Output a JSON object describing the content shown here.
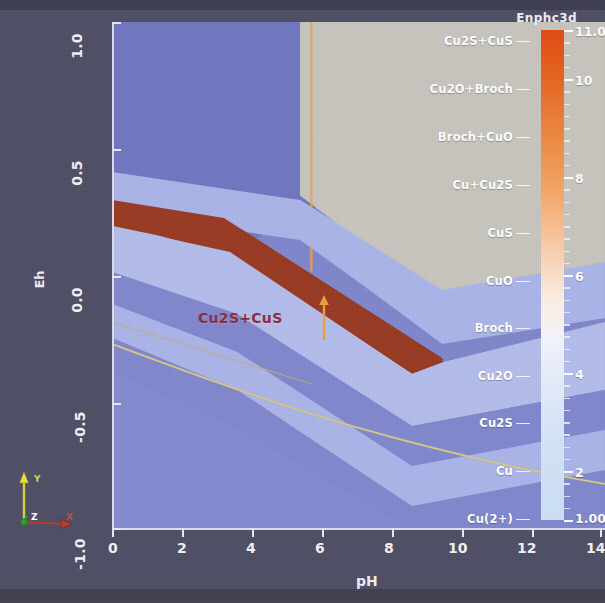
{
  "title": "Enphc3d",
  "axes": {
    "x": {
      "label": "pH",
      "ticks": [
        "0",
        "2",
        "4",
        "6",
        "8",
        "10",
        "12",
        "14"
      ],
      "min": 0,
      "max": 14
    },
    "y": {
      "label": "Eh",
      "ticks": [
        "1.0",
        "0.5",
        "0.0",
        "-0.5",
        "-1.0"
      ],
      "min": -1.0,
      "max": 1.0
    }
  },
  "colorbar": {
    "ticks": [
      "11.0",
      "10",
      "8",
      "6",
      "4",
      "2",
      "1.00"
    ],
    "values": [
      11.0,
      10,
      8,
      6,
      4,
      2,
      1.0
    ],
    "top_color": "#e14a0f",
    "bottom_color": "#cde0f6"
  },
  "region_labels": [
    {
      "text": "Cu2S+CuS",
      "y": 40
    },
    {
      "text": "Cu2O+Broch",
      "y": 88
    },
    {
      "text": "Broch+CuO",
      "y": 136
    },
    {
      "text": "Cu+Cu2S",
      "y": 184
    },
    {
      "text": "CuS",
      "y": 232
    },
    {
      "text": "CuO",
      "y": 280
    },
    {
      "text": "Broch",
      "y": 327
    },
    {
      "text": "Cu2O",
      "y": 375
    },
    {
      "text": "Cu2S",
      "y": 422
    },
    {
      "text": "Cu",
      "y": 470
    },
    {
      "text": "Cu(2+)",
      "y": 518
    }
  ],
  "annotation": {
    "text": "Cu2S+CuS",
    "color": "#8c2a3c",
    "arrow_color": "#e8a13c"
  },
  "gizmo": {
    "x_label": "X",
    "y_label": "Y",
    "z_label": "Z",
    "x_color": "#c0392b",
    "y_color": "#e8e438",
    "z_color": "#2ea02e"
  },
  "chart_data": {
    "type": "heatmap",
    "title": "Enphc3d",
    "xlabel": "pH",
    "ylabel": "Eh",
    "xlim": [
      0,
      14
    ],
    "ylim": [
      -1.0,
      1.0
    ],
    "clim": [
      1.0,
      11.0
    ],
    "grid": false,
    "legend_position": "right",
    "xticks": [
      0,
      2,
      4,
      6,
      8,
      10,
      12,
      14
    ],
    "yticks": [
      -1.0,
      -0.5,
      0.0,
      0.5,
      1.0
    ],
    "colorbar_ticks": [
      1.0,
      2,
      4,
      6,
      8,
      10,
      11.0
    ],
    "phase_fields": [
      "Cu2S+CuS",
      "Cu2O+Broch",
      "Broch+CuO",
      "Cu+Cu2S",
      "CuS",
      "CuO",
      "Broch",
      "Cu2O",
      "Cu2S",
      "Cu",
      "Cu(2+)"
    ]
  }
}
